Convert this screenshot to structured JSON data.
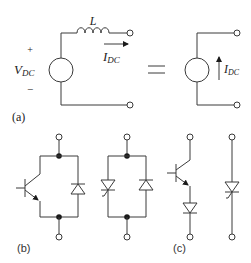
{
  "figure": {
    "panel_a": {
      "caption": "(a)",
      "inductor_label": "L",
      "voltage_label_main": "V",
      "voltage_label_sub": "DC",
      "plus_sign": "+",
      "minus_sign": "−",
      "current_label_main": "I",
      "current_label_sub": "DC",
      "equals_sign": "=",
      "equivalent_current_label_main": "I",
      "equivalent_current_label_sub": "DC"
    },
    "panel_b": {
      "caption": "(b)",
      "components": [
        "IGBT with antiparallel diode",
        "Antiparallel thyristor and diode"
      ]
    },
    "panel_c": {
      "caption": "(c)",
      "components": [
        "IGBT with series diode",
        "Thyristor"
      ]
    },
    "colors": {
      "line": "#3a3a3a",
      "node_dot": "#1a1a1a",
      "background": "#ffffff"
    }
  }
}
